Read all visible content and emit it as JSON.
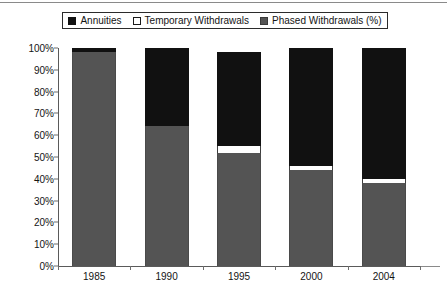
{
  "legend": {
    "entries": [
      {
        "label": "Annuities",
        "swatch": "annuities",
        "color": "#111111"
      },
      {
        "label": "Temporary Withdrawals",
        "swatch": "temporary",
        "color": "#ffffff"
      },
      {
        "label": "Phased Withdrawals (%)",
        "swatch": "phased",
        "color": "#545454"
      }
    ]
  },
  "chart_data": {
    "type": "bar",
    "subtype": "stacked-100-percent",
    "title": "",
    "xlabel": "",
    "ylabel": "",
    "categories": [
      "1985",
      "1990",
      "1995",
      "2000",
      "2004"
    ],
    "series": [
      {
        "name": "Phased Withdrawals (%)",
        "color": "#545454",
        "values": [
          98,
          64,
          52,
          44,
          38
        ]
      },
      {
        "name": "Temporary Withdrawals",
        "color": "#ffffff",
        "values": [
          0,
          0,
          3,
          2,
          2
        ]
      },
      {
        "name": "Annuities",
        "color": "#111111",
        "values": [
          2,
          36,
          43,
          54,
          60
        ]
      }
    ],
    "bar_totals": [
      100,
      100,
      97,
      100,
      100
    ],
    "stack_order_bottom_to_top": [
      "Phased Withdrawals (%)",
      "Temporary Withdrawals",
      "Annuities"
    ],
    "ylim": [
      0,
      100
    ],
    "ytick_labels": [
      "0%",
      "10%",
      "20%",
      "30%",
      "40%",
      "50%",
      "60%",
      "70%",
      "80%",
      "90%",
      "100%"
    ],
    "ytick_values": [
      0,
      10,
      20,
      30,
      40,
      50,
      60,
      70,
      80,
      90,
      100
    ],
    "grid": false,
    "legend_position": "top"
  }
}
